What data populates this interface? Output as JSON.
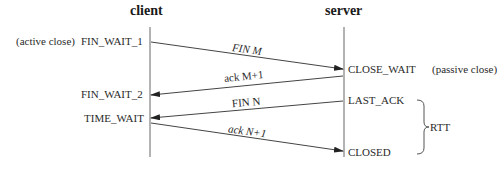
{
  "diagram": {
    "type": "sequence",
    "participants": [
      {
        "id": "client",
        "label": "client"
      },
      {
        "id": "server",
        "label": "server"
      }
    ],
    "client_states": [
      {
        "state": "FIN_WAIT_1",
        "note": "(active close)"
      },
      {
        "state": "FIN_WAIT_2"
      },
      {
        "state": "TIME_WAIT"
      }
    ],
    "server_states": [
      {
        "state": "CLOSE_WAIT",
        "note": "(passive close)"
      },
      {
        "state": "LAST_ACK"
      },
      {
        "state": "CLOSED"
      }
    ],
    "messages": [
      {
        "from": "client",
        "to": "server",
        "prefix": "FIN",
        "value": "M"
      },
      {
        "from": "server",
        "to": "client",
        "prefix": "ack",
        "value": "M+1"
      },
      {
        "from": "server",
        "to": "client",
        "prefix": "FIN",
        "value": "N"
      },
      {
        "from": "client",
        "to": "server",
        "prefix": "ack",
        "value": "N+1"
      }
    ],
    "annotation": {
      "label": "RTT",
      "spans": [
        "LAST_ACK",
        "CLOSED"
      ]
    },
    "colors": {
      "line": "#555555",
      "text": "#2a2a2a"
    }
  }
}
